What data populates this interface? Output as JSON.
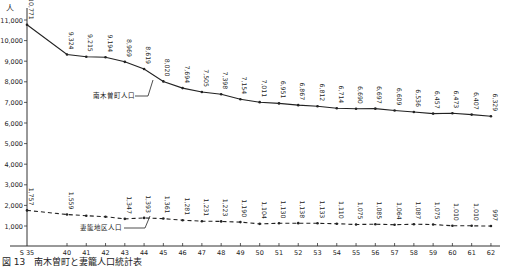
{
  "chart_data": {
    "type": "line",
    "title": "",
    "caption": "図 13　南木曽町と妻籠人口統計表",
    "ylabel": "人",
    "xlabel": "",
    "ylim": [
      0,
      11000
    ],
    "yticks": [
      1000,
      2000,
      3000,
      4000,
      5000,
      6000,
      7000,
      8000,
      9000,
      10000,
      11000
    ],
    "ytick_labels": [
      "1,000",
      "2,000",
      "3,000",
      "4,000",
      "5,000",
      "6,000",
      "7,000",
      "8,000",
      "9,000",
      "10,000",
      "11,000"
    ],
    "categories": [
      "S 35",
      "40",
      "41",
      "42",
      "43",
      "44",
      "45",
      "46",
      "47",
      "48",
      "49",
      "50",
      "51",
      "52",
      "53",
      "54",
      "55",
      "56",
      "57",
      "58",
      "59",
      "60",
      "61",
      "62"
    ],
    "grid": false,
    "series": [
      {
        "name": "南木曽町人口",
        "style": "solid",
        "values": [
          10771,
          9324,
          9215,
          9194,
          8969,
          8619,
          8020,
          7694,
          7505,
          7398,
          7154,
          7011,
          6951,
          6867,
          6812,
          6714,
          6690,
          6697,
          6609,
          6536,
          6457,
          6473,
          6407,
          6329
        ],
        "labels": [
          "10,771",
          "9,324",
          "9,215",
          "9,194",
          "8,969",
          "8,619",
          "8,020",
          "7,694",
          "7,505",
          "7,398",
          "7,154",
          "7,011",
          "6,951",
          "6,867",
          "6,812",
          "6,714",
          "6,690",
          "6,697",
          "6,609",
          "6,536",
          "6,457",
          "6,473",
          "6,407",
          "6,329"
        ],
        "label_indices": [
          0,
          1,
          2,
          3,
          4,
          5,
          6,
          7,
          8,
          9,
          10,
          11,
          12,
          13,
          14,
          15,
          16,
          17,
          18,
          19,
          20,
          21,
          22,
          23
        ]
      },
      {
        "name": "妻籠地区人口",
        "style": "dashed",
        "values": [
          1757,
          1559,
          1500,
          1450,
          1347,
          1393,
          1361,
          1281,
          1231,
          1223,
          1190,
          1104,
          1130,
          1138,
          1133,
          1110,
          1075,
          1085,
          1064,
          1087,
          1075,
          1010,
          1010,
          997
        ],
        "labels": [
          "1,757",
          "1,559",
          "",
          "",
          "1,347",
          "1,393",
          "1,361",
          "1,281",
          "1,231",
          "1,223",
          "1,190",
          "1,104",
          "1,130",
          "1,138",
          "1,133",
          "1,110",
          "1,075",
          "1,085",
          "1,064",
          "1,087",
          "1,075",
          "1,010",
          "1,010",
          "997"
        ],
        "label_indices": [
          0,
          1,
          4,
          5,
          6,
          7,
          8,
          9,
          10,
          11,
          12,
          13,
          14,
          15,
          16,
          17,
          18,
          19,
          20,
          21,
          22,
          23
        ]
      }
    ],
    "annotations": [
      {
        "text": "南木曽町人口",
        "points_to_series": 0
      },
      {
        "text": "妻籠地区人口",
        "points_to_series": 1
      }
    ]
  }
}
